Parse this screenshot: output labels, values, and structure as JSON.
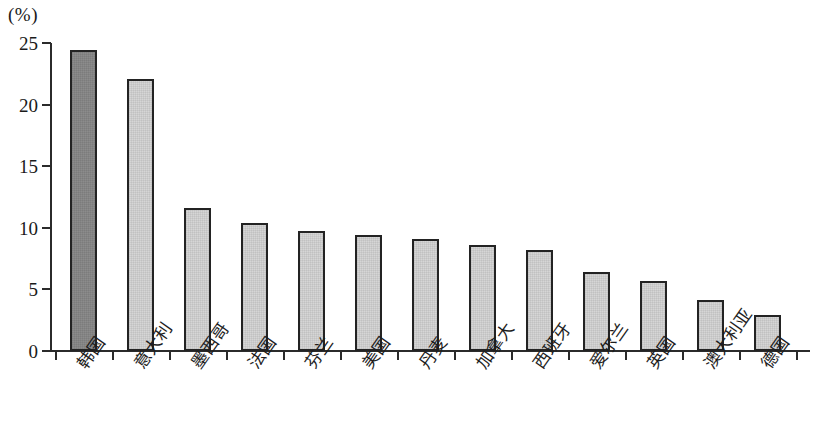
{
  "chart_data": {
    "type": "bar",
    "title": "",
    "subtitle": "",
    "xlabel": "",
    "ylabel": "",
    "unit_label": "(%)",
    "ylim": [
      0,
      25
    ],
    "ytick_values": [
      25,
      20,
      15,
      10,
      5,
      0
    ],
    "ytick_labels": [
      "25",
      "20",
      "15",
      "10",
      "5",
      "0"
    ],
    "grid": false,
    "legend": "none",
    "categories": [
      "韩国",
      "意大利",
      "墨西哥",
      "法国",
      "芬兰",
      "美国",
      "丹麦",
      "加拿大",
      "西班牙",
      "爱尔兰",
      "英国",
      "澳大利亚",
      "德国"
    ],
    "values": [
      24.4,
      22.1,
      11.6,
      10.4,
      9.7,
      9.4,
      9.1,
      8.6,
      8.2,
      6.4,
      5.7,
      4.1,
      2.9
    ],
    "bar_colors": [
      "#8c8c8c",
      "#d6d6d6",
      "#d6d6d6",
      "#d6d6d6",
      "#d6d6d6",
      "#d6d6d6",
      "#d6d6d6",
      "#d6d6d6",
      "#d6d6d6",
      "#d6d6d6",
      "#d6d6d6",
      "#d6d6d6",
      "#d6d6d6"
    ],
    "highlight_index": 0,
    "bar_edge_color": "#232323",
    "axis_color": "#2b2b2b"
  }
}
